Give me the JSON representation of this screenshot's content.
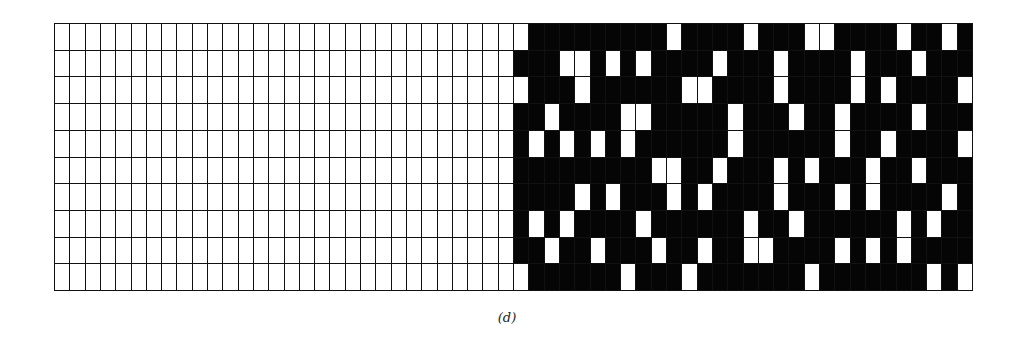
{
  "figure": {
    "caption": "(d)",
    "grid": {
      "rows": 10,
      "cols": 60,
      "dark_region_start_col": 30,
      "colors": {
        "light": "#ffffff",
        "dark": "#050505",
        "line": "#111111"
      },
      "white_cells_in_dark_region": [
        [
          30,
          40,
          45,
          49,
          50,
          55,
          58
        ],
        [
          33,
          34,
          36,
          38,
          43,
          47,
          52,
          56
        ],
        [
          30,
          34,
          41,
          42,
          47,
          52,
          54,
          59
        ],
        [
          32,
          37,
          38,
          44,
          48,
          51,
          56
        ],
        [
          31,
          33,
          35,
          37,
          44,
          51,
          54,
          59
        ],
        [
          39,
          40,
          43,
          47,
          49,
          53,
          56
        ],
        [
          34,
          36,
          40,
          42,
          47,
          51,
          53,
          58
        ],
        [
          31,
          33,
          38,
          45,
          48,
          55,
          57
        ],
        [
          32,
          35,
          39,
          42,
          45,
          46,
          51,
          53,
          55
        ],
        [
          30,
          37,
          41,
          49,
          57,
          59
        ]
      ]
    }
  }
}
